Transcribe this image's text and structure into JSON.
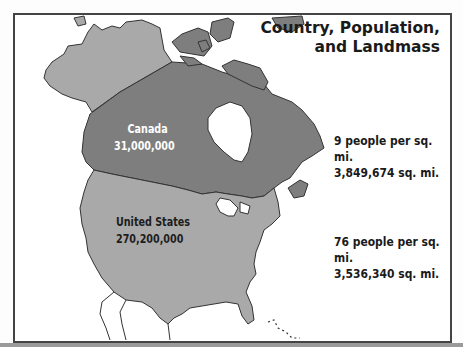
{
  "map": {
    "title_line1": "Country, Population,",
    "title_line2": "and Landmass",
    "colors": {
      "canada": "#7e7e7e",
      "united_states": "#a9a9a9",
      "water": "#ffffff",
      "coastline": "#333333",
      "frame": "#444444"
    },
    "countries": [
      {
        "name": "Canada",
        "population": "31,000,000",
        "density": "9 people per sq. mi.",
        "area": "3,849,674 sq. mi."
      },
      {
        "name": "United States",
        "population": "270,200,000",
        "density": "76 people per sq. mi.",
        "area": "3,536,340 sq. mi."
      }
    ]
  }
}
